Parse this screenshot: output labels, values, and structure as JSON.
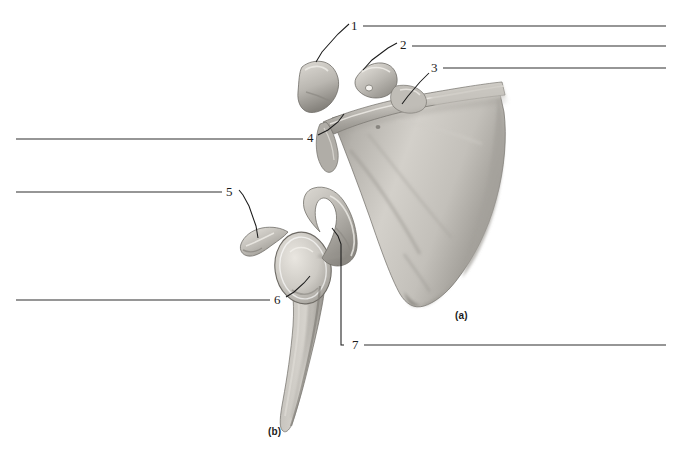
{
  "figure": {
    "background_color": "#ffffff",
    "line_color": "#2e2e2e",
    "bone_color": "#b9b6b0",
    "panels": [
      {
        "id": "a",
        "caption": "(a)",
        "view": "anterior (costal) surface of right scapula"
      },
      {
        "id": "b",
        "caption": "(b)",
        "view": "lateral view of right scapula"
      }
    ],
    "labels": [
      {
        "number": "1",
        "panel": "a",
        "answer_text": ""
      },
      {
        "number": "2",
        "panel": "a",
        "answer_text": ""
      },
      {
        "number": "3",
        "panel": "a",
        "answer_text": ""
      },
      {
        "number": "4",
        "panel": "a",
        "answer_text": ""
      },
      {
        "number": "5",
        "panel": "b",
        "answer_text": ""
      },
      {
        "number": "6",
        "panel": "b",
        "answer_text": ""
      },
      {
        "number": "7",
        "panel": "b",
        "answer_text": ""
      }
    ]
  }
}
